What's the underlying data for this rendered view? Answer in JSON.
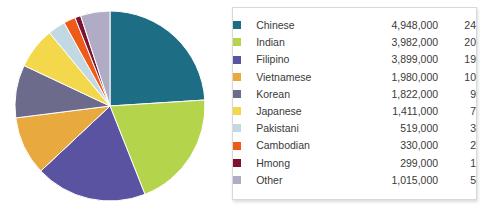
{
  "chart_data": {
    "type": "pie",
    "title": "",
    "subtitle": "",
    "xlabel": "",
    "ylabel": "",
    "legend_position": "right",
    "grid": false,
    "columns": [
      "Group",
      "Population",
      "Percent"
    ],
    "categories": [
      "Chinese",
      "Indian",
      "Filipino",
      "Vietnamese",
      "Korean",
      "Japanese",
      "Pakistani",
      "Cambodian",
      "Hmong",
      "Other"
    ],
    "values": [
      4948000,
      3982000,
      3899000,
      1980000,
      1822000,
      1411000,
      519000,
      330000,
      299000,
      1015000
    ],
    "percents": [
      24,
      20,
      19,
      10,
      9,
      7,
      3,
      2,
      1,
      5
    ],
    "colors": [
      "#1d6d85",
      "#b4d44c",
      "#5a53a1",
      "#e8a93e",
      "#6d6b8c",
      "#f4d84b",
      "#c2d9e4",
      "#ee5b18",
      "#7d1330",
      "#b0acc6"
    ],
    "slices": [
      {
        "label": "Chinese",
        "value_text": "4,948,000",
        "percent_text": "24",
        "value": 4948000,
        "percent": 24,
        "color": "#1d6d85"
      },
      {
        "label": "Indian",
        "value_text": "3,982,000",
        "percent_text": "20",
        "value": 3982000,
        "percent": 20,
        "color": "#b4d44c"
      },
      {
        "label": "Filipino",
        "value_text": "3,899,000",
        "percent_text": "19",
        "value": 3899000,
        "percent": 19,
        "color": "#5a53a1"
      },
      {
        "label": "Vietnamese",
        "value_text": "1,980,000",
        "percent_text": "10",
        "value": 1980000,
        "percent": 10,
        "color": "#e8a93e"
      },
      {
        "label": "Korean",
        "value_text": "1,822,000",
        "percent_text": "9",
        "value": 1822000,
        "percent": 9,
        "color": "#6d6b8c"
      },
      {
        "label": "Japanese",
        "value_text": "1,411,000",
        "percent_text": "7",
        "value": 1411000,
        "percent": 7,
        "color": "#f4d84b"
      },
      {
        "label": "Pakistani",
        "value_text": "519,000",
        "percent_text": "3",
        "value": 519000,
        "percent": 3,
        "color": "#c2d9e4"
      },
      {
        "label": "Cambodian",
        "value_text": "330,000",
        "percent_text": "2",
        "value": 330000,
        "percent": 2,
        "color": "#ee5b18"
      },
      {
        "label": "Hmong",
        "value_text": "299,000",
        "percent_text": "1",
        "value": 299000,
        "percent": 1,
        "color": "#7d1330"
      },
      {
        "label": "Other",
        "value_text": "1,015,000",
        "percent_text": "5",
        "value": 1015000,
        "percent": 5,
        "color": "#b0acc6"
      }
    ]
  }
}
